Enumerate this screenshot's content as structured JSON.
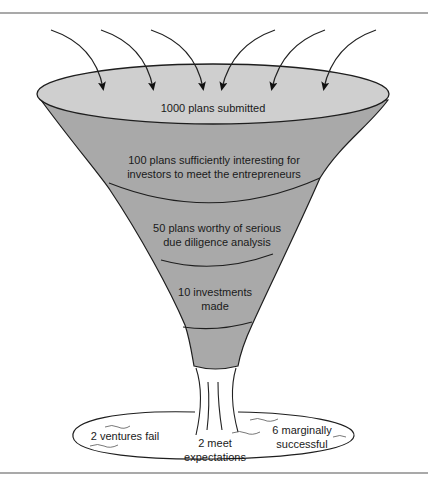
{
  "diagram": {
    "type": "funnel",
    "colors": {
      "funnel_fill": "#a9a9a9",
      "top_fill": "#cfcfcf",
      "stroke": "#1e1e1e",
      "rule": "#555555",
      "background": "#ffffff"
    },
    "inflow_arrows": 6,
    "stages": [
      {
        "id": "stage-1",
        "lines": [
          "1000 plans submitted"
        ]
      },
      {
        "id": "stage-2",
        "lines": [
          "100 plans sufficiently interesting for",
          "investors to meet the entrepreneurs"
        ]
      },
      {
        "id": "stage-3",
        "lines": [
          "50 plans worthy of serious",
          "due diligence analysis"
        ]
      },
      {
        "id": "stage-4",
        "lines": [
          "10 investments",
          "made"
        ]
      }
    ],
    "outcomes": [
      {
        "id": "outcome-fail",
        "lines": [
          "2 ventures fail"
        ]
      },
      {
        "id": "outcome-meet",
        "lines": [
          "2 meet",
          "expectations"
        ]
      },
      {
        "id": "outcome-marginal",
        "lines": [
          "6 marginally",
          "successful"
        ]
      }
    ]
  }
}
